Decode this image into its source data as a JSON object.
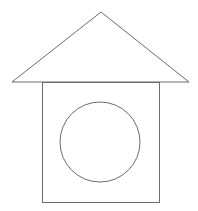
{
  "diagram": {
    "stroke_color": "#6b6b6b",
    "background": "#ffffff",
    "roof": {
      "apex": [
        101,
        12
      ],
      "left": [
        12,
        82
      ],
      "right": [
        189,
        82
      ]
    },
    "body": {
      "x": 42,
      "y": 82,
      "width": 117,
      "height": 120
    },
    "window": {
      "cx": 100,
      "cy": 142,
      "r": 40
    }
  }
}
